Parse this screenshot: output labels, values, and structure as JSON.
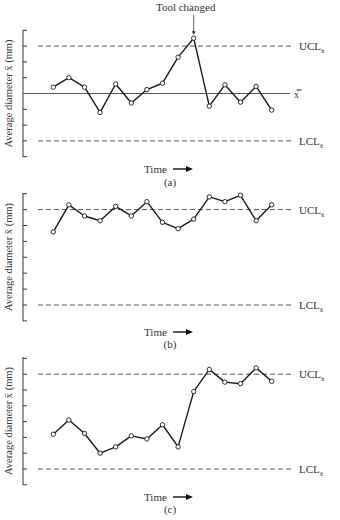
{
  "figure": {
    "annotation": "Tool changed",
    "ylabel": "Average diameter x̄ (mm)",
    "xlabel": "Time",
    "ucl_label": "UCL",
    "lcl_label": "LCL",
    "label_subscript": "x̄",
    "center_label": "x̿",
    "colors": {
      "line": "#1a1a1a",
      "axis": "#333333",
      "dash": "#555555",
      "marker_fill": "#ffffff"
    }
  },
  "chart_data": [
    {
      "type": "line",
      "panel_label": "(a)",
      "title": "",
      "xlabel": "Time",
      "ylabel": "Average diameter x̄ (mm)",
      "annotation": {
        "text": "Tool changed",
        "at_index": 9
      },
      "control_lines": {
        "UCL": 3,
        "center": 0,
        "LCL": -3,
        "center_line_visible": true
      },
      "ylim": [
        -4,
        4
      ],
      "grid": false,
      "x": [
        1,
        2,
        3,
        4,
        5,
        6,
        7,
        8,
        9,
        10,
        11,
        12,
        13,
        14,
        15
      ],
      "values": [
        0.4,
        1.0,
        0.4,
        -1.2,
        0.6,
        -0.6,
        0.25,
        0.65,
        2.3,
        3.5,
        -0.8,
        0.55,
        -0.55,
        0.45,
        -1.05
      ]
    },
    {
      "type": "line",
      "panel_label": "(b)",
      "title": "",
      "xlabel": "Time",
      "ylabel": "Average diameter x̄ (mm)",
      "control_lines": {
        "UCL": 3,
        "center": 0,
        "LCL": -3,
        "center_line_visible": false
      },
      "ylim": [
        -4,
        4
      ],
      "grid": false,
      "x": [
        1,
        2,
        3,
        4,
        5,
        6,
        7,
        8,
        9,
        10,
        11,
        12,
        13,
        14,
        15
      ],
      "values": [
        1.6,
        3.3,
        2.6,
        2.3,
        3.2,
        2.6,
        3.5,
        2.2,
        1.8,
        2.4,
        3.8,
        3.5,
        3.9,
        2.3,
        3.3
      ]
    },
    {
      "type": "line",
      "panel_label": "(c)",
      "title": "",
      "xlabel": "Time",
      "ylabel": "Average diameter x̄ (mm)",
      "control_lines": {
        "UCL": 3,
        "center": 0,
        "LCL": -3,
        "center_line_visible": false
      },
      "ylim": [
        -4,
        4
      ],
      "grid": false,
      "x": [
        1,
        2,
        3,
        4,
        5,
        6,
        7,
        8,
        9,
        10,
        11,
        12,
        13,
        14,
        15
      ],
      "values": [
        -0.8,
        0.1,
        -0.75,
        -2.0,
        -1.6,
        -0.9,
        -1.1,
        -0.2,
        -1.6,
        1.9,
        3.3,
        2.5,
        2.4,
        3.4,
        2.55
      ]
    }
  ]
}
